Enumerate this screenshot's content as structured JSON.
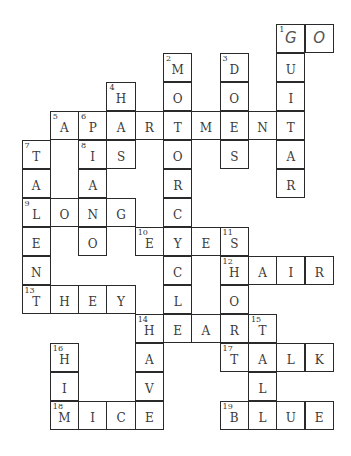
{
  "puzzle": {
    "type": "crossword",
    "grid_cols": 11,
    "grid_rows": 14,
    "cells": [
      {
        "r": 0,
        "c": 9,
        "n": "1",
        "l": "G",
        "hand": true
      },
      {
        "r": 0,
        "c": 10,
        "l": "O",
        "hand": true
      },
      {
        "r": 1,
        "c": 5,
        "n": "2",
        "l": "M"
      },
      {
        "r": 1,
        "c": 7,
        "n": "3",
        "l": "D"
      },
      {
        "r": 1,
        "c": 9,
        "l": "U"
      },
      {
        "r": 2,
        "c": 3,
        "n": "4",
        "l": "H"
      },
      {
        "r": 2,
        "c": 5,
        "l": "O"
      },
      {
        "r": 2,
        "c": 7,
        "l": "O"
      },
      {
        "r": 2,
        "c": 9,
        "l": "I"
      },
      {
        "r": 3,
        "c": 1,
        "n": "5",
        "l": "A"
      },
      {
        "r": 3,
        "c": 2,
        "n": "6",
        "l": "P"
      },
      {
        "r": 3,
        "c": 3,
        "l": "A"
      },
      {
        "r": 3,
        "c": 4,
        "l": "R"
      },
      {
        "r": 3,
        "c": 5,
        "l": "T"
      },
      {
        "r": 3,
        "c": 6,
        "l": "M"
      },
      {
        "r": 3,
        "c": 7,
        "l": "E"
      },
      {
        "r": 3,
        "c": 8,
        "l": "N"
      },
      {
        "r": 3,
        "c": 9,
        "l": "T"
      },
      {
        "r": 4,
        "c": 0,
        "n": "7",
        "l": "T"
      },
      {
        "r": 4,
        "c": 2,
        "n": "8",
        "l": "I"
      },
      {
        "r": 4,
        "c": 3,
        "l": "S"
      },
      {
        "r": 4,
        "c": 5,
        "l": "O"
      },
      {
        "r": 4,
        "c": 7,
        "l": "S"
      },
      {
        "r": 4,
        "c": 9,
        "l": "A"
      },
      {
        "r": 5,
        "c": 0,
        "l": "A"
      },
      {
        "r": 5,
        "c": 2,
        "l": "A"
      },
      {
        "r": 5,
        "c": 5,
        "l": "R"
      },
      {
        "r": 5,
        "c": 9,
        "l": "R"
      },
      {
        "r": 6,
        "c": 0,
        "n": "9",
        "l": "L"
      },
      {
        "r": 6,
        "c": 1,
        "l": "O"
      },
      {
        "r": 6,
        "c": 2,
        "l": "N"
      },
      {
        "r": 6,
        "c": 3,
        "l": "G"
      },
      {
        "r": 6,
        "c": 5,
        "l": "C"
      },
      {
        "r": 7,
        "c": 0,
        "l": "E"
      },
      {
        "r": 7,
        "c": 2,
        "l": "O"
      },
      {
        "r": 7,
        "c": 4,
        "n": "10",
        "l": "E"
      },
      {
        "r": 7,
        "c": 5,
        "l": "Y"
      },
      {
        "r": 7,
        "c": 6,
        "l": "E"
      },
      {
        "r": 7,
        "c": 7,
        "n": "11",
        "l": "S"
      },
      {
        "r": 8,
        "c": 0,
        "l": "N"
      },
      {
        "r": 8,
        "c": 5,
        "l": "C"
      },
      {
        "r": 8,
        "c": 7,
        "n": "12",
        "l": "H"
      },
      {
        "r": 8,
        "c": 8,
        "l": "A"
      },
      {
        "r": 8,
        "c": 9,
        "l": "I"
      },
      {
        "r": 8,
        "c": 10,
        "l": "R"
      },
      {
        "r": 9,
        "c": 0,
        "n": "13",
        "l": "T"
      },
      {
        "r": 9,
        "c": 1,
        "l": "H"
      },
      {
        "r": 9,
        "c": 2,
        "l": "E"
      },
      {
        "r": 9,
        "c": 3,
        "l": "Y"
      },
      {
        "r": 9,
        "c": 5,
        "l": "L"
      },
      {
        "r": 9,
        "c": 7,
        "l": "O"
      },
      {
        "r": 10,
        "c": 4,
        "n": "14",
        "l": "H"
      },
      {
        "r": 10,
        "c": 5,
        "l": "E"
      },
      {
        "r": 10,
        "c": 6,
        "l": "A"
      },
      {
        "r": 10,
        "c": 7,
        "l": "R"
      },
      {
        "r": 10,
        "c": 8,
        "n": "15",
        "l": "T"
      },
      {
        "r": 11,
        "c": 1,
        "n": "16",
        "l": "H"
      },
      {
        "r": 11,
        "c": 4,
        "l": "A"
      },
      {
        "r": 11,
        "c": 7,
        "n": "17",
        "l": "T"
      },
      {
        "r": 11,
        "c": 8,
        "l": "A"
      },
      {
        "r": 11,
        "c": 9,
        "l": "L"
      },
      {
        "r": 11,
        "c": 10,
        "l": "K"
      },
      {
        "r": 12,
        "c": 1,
        "l": "I"
      },
      {
        "r": 12,
        "c": 4,
        "l": "V"
      },
      {
        "r": 12,
        "c": 8,
        "l": "L"
      },
      {
        "r": 13,
        "c": 1,
        "n": "18",
        "l": "M"
      },
      {
        "r": 13,
        "c": 2,
        "l": "I"
      },
      {
        "r": 13,
        "c": 3,
        "l": "C"
      },
      {
        "r": 13,
        "c": 4,
        "l": "E"
      },
      {
        "r": 13,
        "c": 7,
        "n": "19",
        "l": "B"
      },
      {
        "r": 13,
        "c": 8,
        "l": "L"
      },
      {
        "r": 13,
        "c": 9,
        "l": "U"
      },
      {
        "r": 13,
        "c": 10,
        "l": "E"
      }
    ],
    "across": [
      "1 GO",
      "5 APARTMENT",
      "8 IS",
      "9 LONG",
      "10 EYES",
      "12 HAIR",
      "13 THEY",
      "14 HEART",
      "17 TALK",
      "18 MICE",
      "19 BLUE"
    ],
    "down": [
      "1 GUITAR",
      "2 MOTORCYCLE",
      "3 DOES",
      "4 HAS",
      "6 PIANO",
      "7 TALENT",
      "11 SHORT",
      "14 HAVE",
      "15 TELL",
      "16 HIM"
    ]
  },
  "colors": {
    "line": "#2a2a2a",
    "text": "#3a3a3a",
    "background": "#ffffff"
  }
}
